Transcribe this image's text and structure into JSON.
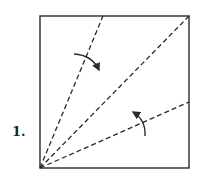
{
  "diagram": {
    "type": "origami-fold-step",
    "step_label": "1.",
    "square": {
      "x1": 40,
      "y1": 16,
      "x2": 189,
      "y2": 168
    },
    "colors": {
      "line": "#2a2a2a",
      "background": "#ffffff"
    },
    "fold_lines": [
      {
        "name": "upper-valley-fold",
        "style": "dashed",
        "from": [
          40,
          168
        ],
        "to": [
          103,
          16
        ]
      },
      {
        "name": "diagonal-valley-fold",
        "style": "dashed",
        "from": [
          40,
          168
        ],
        "to": [
          189,
          16
        ]
      },
      {
        "name": "lower-valley-fold",
        "style": "dashed",
        "from": [
          40,
          168
        ],
        "to": [
          189,
          102
        ]
      }
    ],
    "arrows": [
      {
        "name": "fold-arrow-upper",
        "direction": "clockwise",
        "from": [
          74,
          54
        ],
        "to": [
          99,
          70
        ]
      },
      {
        "name": "fold-arrow-lower",
        "direction": "counterclockwise",
        "from": [
          145,
          136
        ],
        "to": [
          133,
          112
        ]
      }
    ]
  }
}
